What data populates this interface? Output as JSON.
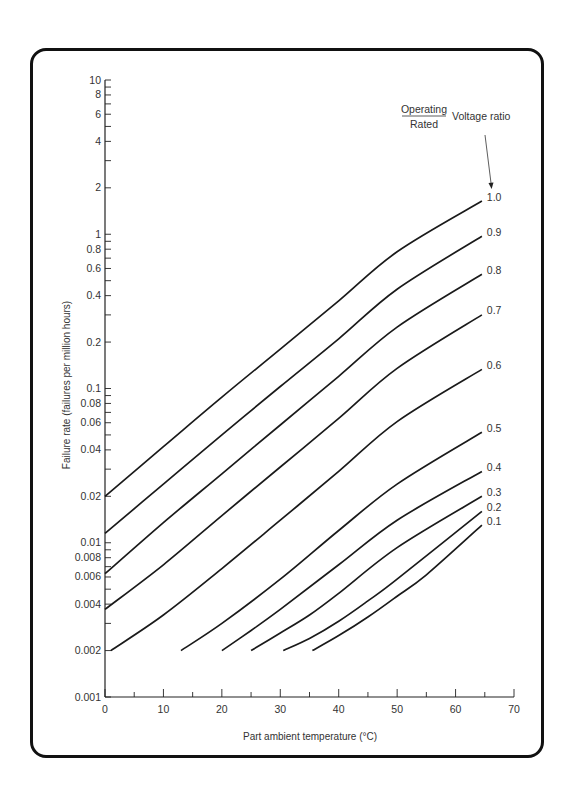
{
  "chart_data": {
    "type": "line",
    "title": "",
    "xlabel": "Part ambient temperature (°C)",
    "ylabel": "Failure rate (failures per million hours)",
    "xlim": [
      0,
      70
    ],
    "ylim": [
      0.001,
      10
    ],
    "yscale": "log",
    "grid": false,
    "x_ticks": [
      0,
      10,
      20,
      30,
      40,
      50,
      60,
      70
    ],
    "y_tick_labels": [
      "10",
      "8",
      "6",
      "4",
      "2",
      "1",
      "0.8",
      "0.6",
      "0.4",
      "0.2",
      "0.1",
      "0.08",
      "0.06",
      "0.04",
      "0.02",
      "0.01",
      "0.008",
      "0.006",
      "0.004",
      "0.002",
      "0.001"
    ],
    "legend": {
      "title_numerator": "Operating",
      "title_denominator": "Rated",
      "title_suffix": "Voltage ratio",
      "position": "top-right, with arrow pointing to 1.0 curve"
    },
    "series": [
      {
        "name": "1.0",
        "x": [
          0,
          10,
          20,
          30,
          40,
          50,
          64.5
        ],
        "y": [
          0.02,
          0.042,
          0.088,
          0.18,
          0.37,
          0.77,
          1.64
        ]
      },
      {
        "name": "0.9",
        "x": [
          0,
          10,
          20,
          30,
          40,
          50,
          64.5
        ],
        "y": [
          0.0115,
          0.024,
          0.05,
          0.103,
          0.21,
          0.44,
          0.97
        ]
      },
      {
        "name": "0.8",
        "x": [
          0,
          10,
          20,
          30,
          40,
          50,
          64.5
        ],
        "y": [
          0.0063,
          0.0135,
          0.028,
          0.058,
          0.12,
          0.25,
          0.55
        ]
      },
      {
        "name": "0.7",
        "x": [
          0,
          10,
          20,
          30,
          40,
          50,
          64.5
        ],
        "y": [
          0.0037,
          0.0072,
          0.015,
          0.031,
          0.064,
          0.135,
          0.3
        ]
      },
      {
        "name": "0.6",
        "x": [
          1,
          10,
          20,
          30,
          40,
          50,
          64.5
        ],
        "y": [
          0.002,
          0.0034,
          0.0068,
          0.014,
          0.029,
          0.061,
          0.133
        ]
      },
      {
        "name": "0.5",
        "x": [
          13,
          20,
          30,
          40,
          50,
          64.5
        ],
        "y": [
          0.002,
          0.003,
          0.0058,
          0.012,
          0.024,
          0.052
        ]
      },
      {
        "name": "0.4",
        "x": [
          20,
          25,
          30,
          40,
          50,
          64.5
        ],
        "y": [
          0.002,
          0.0027,
          0.0037,
          0.0072,
          0.014,
          0.029
        ]
      },
      {
        "name": "0.3",
        "x": [
          25,
          30,
          35,
          40,
          50,
          64.5
        ],
        "y": [
          0.002,
          0.0026,
          0.0034,
          0.0047,
          0.0093,
          0.02
        ]
      },
      {
        "name": "0.2",
        "x": [
          30.5,
          35,
          40,
          45,
          50,
          64.5
        ],
        "y": [
          0.002,
          0.0024,
          0.0031,
          0.0042,
          0.0058,
          0.016
        ]
      },
      {
        "name": "0.1",
        "x": [
          35.5,
          40,
          45,
          50,
          55,
          64.5
        ],
        "y": [
          0.002,
          0.0025,
          0.0033,
          0.0045,
          0.0062,
          0.013
        ]
      }
    ]
  },
  "colors": {
    "line": "#1a1a1a",
    "text": "#333333",
    "frame": "#111111",
    "background": "#ffffff"
  }
}
